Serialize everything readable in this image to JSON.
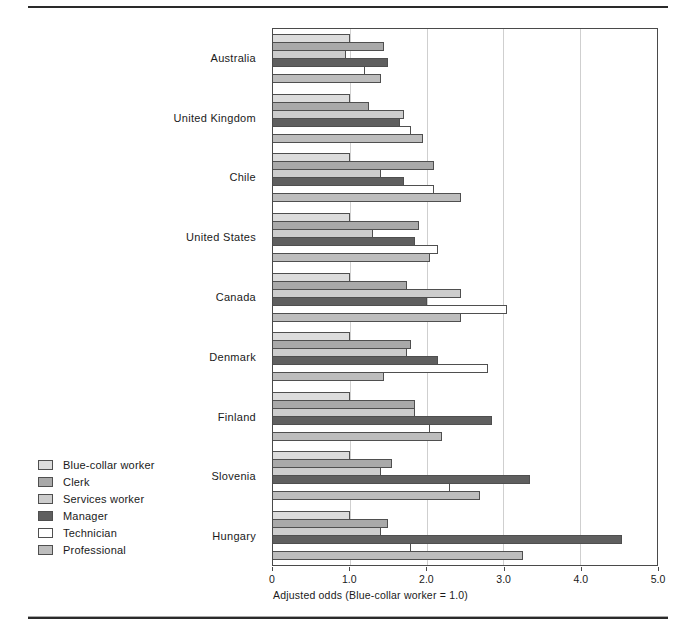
{
  "chart_data": {
    "type": "bar",
    "orientation": "horizontal",
    "title": "",
    "xlabel": "Adjusted odds (Blue-collar worker = 1.0)",
    "ylabel": "",
    "xlim": [
      0,
      5.0
    ],
    "x_ticks": [
      "0",
      "1.0",
      "2.0",
      "3.0",
      "4.0",
      "5.0"
    ],
    "x_tick_values": [
      0,
      1.0,
      2.0,
      3.0,
      4.0,
      5.0
    ],
    "gridlines_at": [
      1.0,
      2.0,
      3.0,
      4.0
    ],
    "grid": "vertical light-gray gridlines, framed plot area",
    "legend_position": "outside bottom-left",
    "bar_border_color": "#4f4f4f",
    "categories": [
      "Australia",
      "United Kingdom",
      "Chile",
      "United States",
      "Canada",
      "Denmark",
      "Finland",
      "Slovenia",
      "Hungary"
    ],
    "series": [
      {
        "name": "Blue-collar worker",
        "color": "#dcdcdc",
        "values": [
          1.0,
          1.0,
          1.0,
          1.0,
          1.0,
          1.0,
          1.0,
          1.0,
          1.0
        ]
      },
      {
        "name": "Clerk",
        "color": "#a9a9a9",
        "values": [
          1.45,
          1.25,
          2.1,
          1.9,
          1.75,
          1.8,
          1.85,
          1.55,
          1.5
        ]
      },
      {
        "name": "Services worker",
        "color": "#cdcdcd",
        "values": [
          0.95,
          1.7,
          1.4,
          1.3,
          2.45,
          1.75,
          1.85,
          1.4,
          1.4
        ]
      },
      {
        "name": "Manager",
        "color": "#5f5f5f",
        "values": [
          1.5,
          1.65,
          1.7,
          1.85,
          2.0,
          2.15,
          2.85,
          3.35,
          4.55
        ]
      },
      {
        "name": "Technician",
        "color": "#ffffff",
        "values": [
          1.2,
          1.8,
          2.1,
          2.15,
          3.05,
          2.8,
          2.05,
          2.3,
          1.8
        ]
      },
      {
        "name": "Professional",
        "color": "#bdbdbd",
        "values": [
          1.4,
          1.95,
          2.45,
          2.05,
          2.45,
          1.45,
          2.2,
          2.7,
          3.25
        ]
      }
    ]
  }
}
